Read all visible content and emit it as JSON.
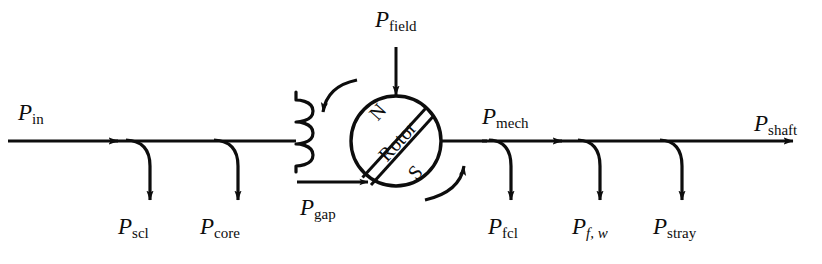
{
  "diagram": {
    "type": "power-flow",
    "stroke_color": "#0d0d0d",
    "background": "#ffffff",
    "machine": {
      "rotor_label": "Rotor",
      "pole_north": "N",
      "pole_south": "S",
      "rotation": "counterclockwise"
    },
    "labels": {
      "p_in": {
        "symbol": "P",
        "sub": "in"
      },
      "p_scl": {
        "symbol": "P",
        "sub": "scl"
      },
      "p_core": {
        "symbol": "P",
        "sub": "core"
      },
      "p_gap": {
        "symbol": "P",
        "sub": "gap"
      },
      "p_field": {
        "symbol": "P",
        "sub": "field"
      },
      "p_mech": {
        "symbol": "P",
        "sub": "mech"
      },
      "p_fcl": {
        "symbol": "P",
        "sub": "fcl"
      },
      "p_fw": {
        "symbol": "P",
        "sub": "f, w"
      },
      "p_stray": {
        "symbol": "P",
        "sub": "stray"
      },
      "p_shaft": {
        "symbol": "P",
        "sub": "shaft"
      }
    }
  }
}
